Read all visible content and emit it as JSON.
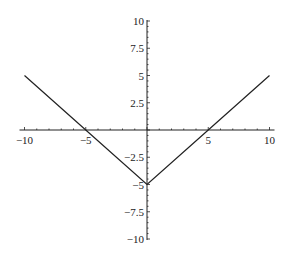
{
  "chart_data": {
    "type": "line",
    "title": "",
    "xlabel": "",
    "ylabel": "",
    "xlim": [
      -10,
      10
    ],
    "ylim": [
      -10,
      10
    ],
    "grid": false,
    "legend": null,
    "x_ticks": [
      -10,
      -5,
      5,
      10
    ],
    "x_tick_labels": [
      "-10",
      "-5",
      "5",
      "10"
    ],
    "y_ticks": [
      10,
      7.5,
      5,
      2.5,
      -2.5,
      -5,
      -7.5,
      -10
    ],
    "y_tick_labels": [
      "10",
      "7.5",
      "5",
      "2.5",
      "-2.5",
      "-5",
      "-7.5",
      "-10"
    ],
    "series": [
      {
        "name": "y = |x| - 5",
        "x": [
          -10,
          -5,
          0,
          5,
          10
        ],
        "y": [
          5,
          0,
          -5,
          0,
          5
        ]
      }
    ],
    "colors": {
      "line": "#222222",
      "axis": "#222222",
      "background": "#ffffff"
    }
  }
}
